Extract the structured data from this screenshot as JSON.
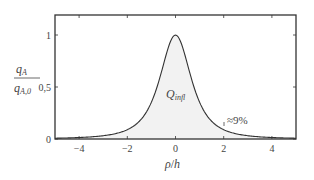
{
  "chart_data": {
    "type": "area",
    "title": "",
    "xlabel": "ρ/h",
    "ylabel": "q_A / q_A,0",
    "ylabel_numerator": "q",
    "ylabel_numerator_sub": "A",
    "ylabel_denominator": "q",
    "ylabel_denominator_sub": "A,0",
    "xlim": [
      -5,
      5
    ],
    "ylim": [
      0,
      1.1
    ],
    "x_ticks": [
      -4,
      -2,
      0,
      2,
      4
    ],
    "x_tick_labels": [
      "−4",
      "−2",
      "0",
      "2",
      "4"
    ],
    "y_ticks": [
      0,
      0.5,
      1
    ],
    "y_tick_labels": [
      "0",
      "0,5",
      "1"
    ],
    "grid": false,
    "legend": null,
    "series": [
      {
        "name": "q_A/q_A,0",
        "formula": "(1 + (ρ/h)^2)^(-3/2)",
        "x": [
          -5,
          -4,
          -3,
          -2,
          -1.5,
          -1,
          -0.5,
          0,
          0.5,
          1,
          1.5,
          2,
          3,
          4,
          5
        ],
        "values": [
          0.008,
          0.014,
          0.032,
          0.089,
          0.171,
          0.354,
          0.716,
          1.0,
          0.716,
          0.354,
          0.171,
          0.089,
          0.032,
          0.014,
          0.008
        ],
        "fill": "#f2f2f2",
        "line_color": "#333333"
      }
    ],
    "annotations": [
      {
        "text": "Q",
        "subscript": "infl",
        "x": 0,
        "y": 0.4,
        "label": "Q_infl"
      },
      {
        "text": "≈9%",
        "x": 2,
        "y": 0.089
      }
    ]
  },
  "labels": {
    "area_main": "Q",
    "area_sub": "infl",
    "pct_annotation": "≈9%",
    "xlabel_rho": "ρ",
    "xlabel_slash": "/",
    "xlabel_h": "h",
    "y_num_q": "q",
    "y_num_sub": "A",
    "y_den_q": "q",
    "y_den_sub": "A,0"
  }
}
